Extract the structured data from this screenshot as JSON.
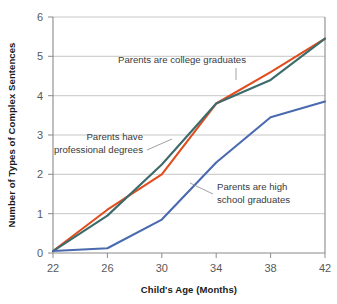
{
  "chart_data": {
    "type": "line",
    "title": "",
    "xlabel": "Child's Age (Months)",
    "ylabel": "Number of Types of Complex Sentences",
    "x": [
      22,
      26,
      30,
      34,
      38,
      42
    ],
    "xlim": [
      22,
      42
    ],
    "ylim": [
      0,
      6
    ],
    "xticks": [
      "22",
      "26",
      "30",
      "34",
      "38",
      "42"
    ],
    "yticks": [
      "0",
      "1",
      "2",
      "3",
      "4",
      "5",
      "6"
    ],
    "grid": "horizontal",
    "legend_position": "inline-annotations",
    "series": [
      {
        "name": "Parents are college graduates",
        "color": "#e04e1f",
        "values": [
          0.05,
          1.1,
          2.0,
          3.8,
          4.6,
          5.45
        ]
      },
      {
        "name": "Parents have professional degrees",
        "color": "#3d6b6b",
        "values": [
          0.05,
          0.95,
          2.25,
          3.8,
          4.4,
          5.45
        ]
      },
      {
        "name": "Parents are high school graduates",
        "color": "#4a6ab0",
        "values": [
          0.05,
          0.12,
          0.85,
          2.3,
          3.45,
          3.85
        ]
      }
    ],
    "annotations": [
      {
        "id": "annotation-college-graduates",
        "lines": [
          "Parents are college graduates"
        ],
        "align": "start",
        "x": 118,
        "y": 63,
        "leader": "M 236 68 L 236 80"
      },
      {
        "id": "annotation-professional-degrees",
        "lines": [
          "Parents have",
          "professional degrees"
        ],
        "align": "end",
        "x": 143,
        "y": 140,
        "leader": "M 147 150 L 172 139"
      },
      {
        "id": "annotation-high-school-graduates",
        "lines": [
          "Parents are high",
          "school graduates"
        ],
        "align": "start",
        "x": 217,
        "y": 190,
        "leader": "M 213 194 L 190 183"
      }
    ]
  },
  "axes": {
    "x_title": "Child's Age (Months)",
    "y_title": "Number of Types of Complex Sentences"
  }
}
